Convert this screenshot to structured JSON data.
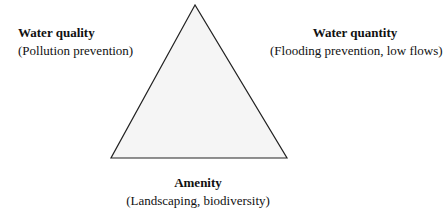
{
  "diagram": {
    "shape": "triangle",
    "fill_color": "#f5f5f5",
    "stroke_color": "#222222",
    "vertices": {
      "top": [
        195,
        5
      ],
      "bottom_left": [
        111,
        158
      ],
      "bottom_right": [
        287,
        158
      ]
    },
    "labels": {
      "left": {
        "title": "Water quality",
        "subtitle": "(Pollution prevention)"
      },
      "right": {
        "title": "Water quantity",
        "subtitle": "(Flooding prevention, low flows)"
      },
      "bottom": {
        "title": "Amenity",
        "subtitle": "(Landscaping, biodiversity)"
      }
    }
  }
}
